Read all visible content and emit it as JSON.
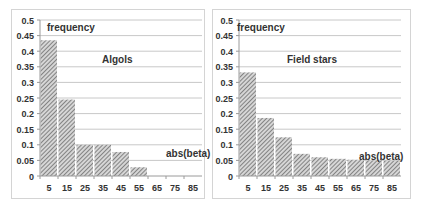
{
  "chart_data": [
    {
      "type": "bar",
      "title": "Algols",
      "xlabel": "abs(beta)",
      "ylabel": "frequency",
      "categories": [
        "5",
        "15",
        "25",
        "35",
        "45",
        "55",
        "65",
        "75",
        "85"
      ],
      "values": [
        0.435,
        0.245,
        0.1,
        0.1,
        0.077,
        0.028,
        0,
        0,
        0
      ],
      "ylim": [
        0,
        0.5
      ],
      "yticks": [
        "0",
        "0.05",
        "0.1",
        "0.15",
        "0.2",
        "0.25",
        "0.3",
        "0.35",
        "0.4",
        "0.45",
        "0.5"
      ],
      "grid": true,
      "legend": "none",
      "bar_fill": "diagonal-hatch gray"
    },
    {
      "type": "bar",
      "title": "Field stars",
      "xlabel": "abs(beta)",
      "ylabel": "frequency",
      "categories": [
        "5",
        "15",
        "25",
        "35",
        "45",
        "55",
        "65",
        "75",
        "85"
      ],
      "values": [
        0.332,
        0.186,
        0.124,
        0.071,
        0.06,
        0.055,
        0.052,
        0.05,
        0.049
      ],
      "ylim": [
        0,
        0.5
      ],
      "yticks": [
        "0",
        "0.05",
        "0.1",
        "0.15",
        "0.2",
        "0.25",
        "0.3",
        "0.35",
        "0.4",
        "0.45",
        "0.5"
      ],
      "grid": true,
      "legend": "none",
      "bar_fill": "diagonal-hatch gray"
    }
  ],
  "panels": [
    {
      "title": "Algols",
      "ylabel": "frequency",
      "xlabel": "abs(beta)"
    },
    {
      "title": "Field stars",
      "ylabel": "frequency",
      "xlabel": "abs(beta)"
    }
  ],
  "colors": {
    "grid": "#c8c8c8",
    "axis": "#9a9a9a",
    "bar": "#8c8c8c",
    "text": "#333333"
  }
}
